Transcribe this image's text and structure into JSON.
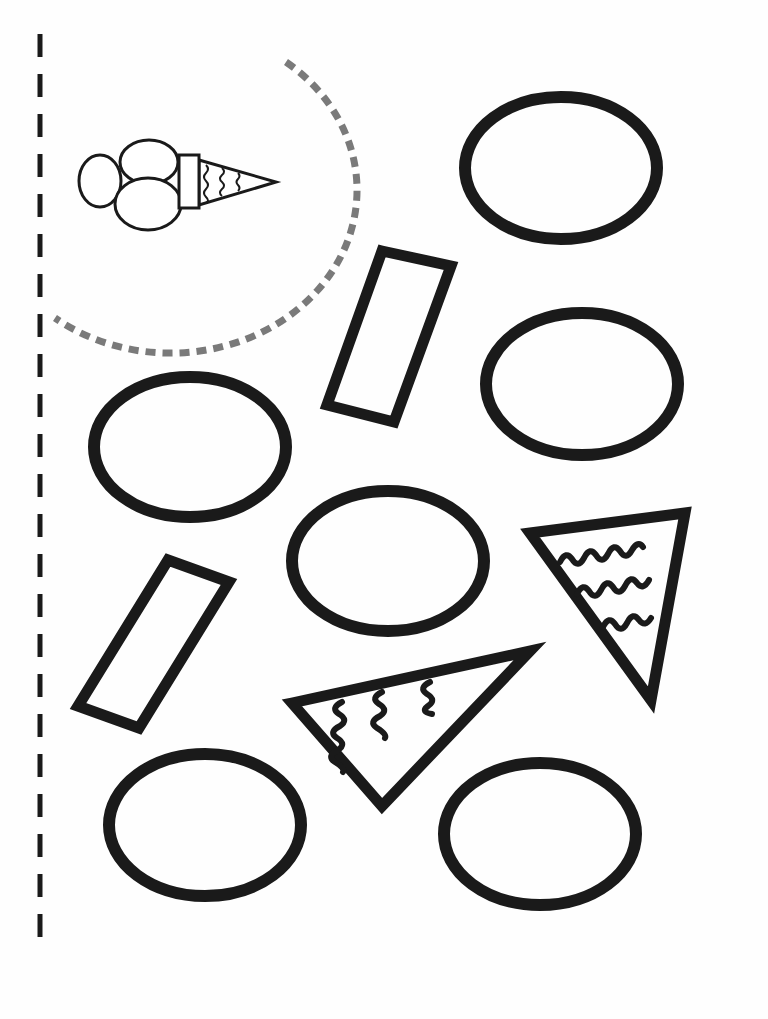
{
  "worksheet": {
    "title": "Ice cream cut-and-paste shapes",
    "stroke_color": "#1a1a1a",
    "guide_color": "#7a7a7a",
    "paper_color": "#fefefe"
  },
  "cut_line": {
    "x": 40,
    "y_start": 34,
    "y_end": 968,
    "dash": 23,
    "gap": 17,
    "width": 5
  },
  "guide_arc": {
    "path": "M 286 62 A 183 160 0 1 1 55 318",
    "dash": "10 7",
    "width": 7
  },
  "sample_icon": {
    "name": "ice-cream-cone",
    "scoops": [
      {
        "cx": 100,
        "cy": 181,
        "rx": 21,
        "ry": 26
      },
      {
        "cx": 149,
        "cy": 162,
        "rx": 29,
        "ry": 22
      },
      {
        "cx": 148,
        "cy": 204,
        "rx": 33,
        "ry": 26
      }
    ],
    "band": {
      "x": 179,
      "y": 155,
      "w": 20,
      "h": 53
    },
    "cone": "199,160 276,182 199,205",
    "waves": [
      "M 206 165 q 4 4 0 8 q -4 4 0 8 q 4 4 0 8 q -4 4 0 8 q 4 4 0 6",
      "M 222 168 q 4 4 0 7 q -4 4 0 7 q 4 4 0 7 q -4 4 0 7",
      "M 238 173 q 3 3 0 6 q -3 3 0 6 q 3 3 0 6"
    ],
    "stroke_width": 3
  },
  "ovals": [
    {
      "id": 1,
      "cx": 561,
      "cy": 168,
      "rx": 102,
      "ry": 77
    },
    {
      "id": 2,
      "cx": 582,
      "cy": 384,
      "rx": 102,
      "ry": 77
    },
    {
      "id": 3,
      "cx": 190,
      "cy": 447,
      "rx": 102,
      "ry": 76
    },
    {
      "id": 4,
      "cx": 388,
      "cy": 561,
      "rx": 102,
      "ry": 76
    },
    {
      "id": 5,
      "cx": 205,
      "cy": 825,
      "rx": 102,
      "ry": 77
    },
    {
      "id": 6,
      "cx": 540,
      "cy": 834,
      "rx": 102,
      "ry": 77
    }
  ],
  "oval_stroke": 12,
  "bands": [
    {
      "id": 1,
      "points": "382,251 451,266 394,422 327,405"
    },
    {
      "id": 2,
      "points": "168,560 229,582 139,728 78,706"
    }
  ],
  "band_stroke": 11,
  "cones": [
    {
      "id": 1,
      "points": "530,533 685,513 651,700",
      "waves": [
        "M 560 562 q 6 -12 12 -3 q 6 10 12 -1 q 6 -12 12 -3 q 6 10 12 -1 q 6 -12 12 -3 q 6 10 12 -1 q 6 -10 11 -3",
        "M 577 594 q 6 -12 12 -3 q 6 10 12 -1 q 6 -12 12 -3 q 6 10 12 -1 q 6 -12 12 -3 q 6 8 12 -3",
        "M 603 627 q 6 -12 12 -3 q 6 10 12 -1 q 6 -12 12 -3 q 6 8 12 -2"
      ]
    },
    {
      "id": 2,
      "points": "292,703 530,651 382,806",
      "waves": [
        "M 342 702 q -12 6 -3 12 q 10 6 1 12 q -12 6 -3 12 q 10 6 1 12 q -12 6 -3 12 q 10 6 8 10",
        "M 382 692 q -12 6 -3 12 q 10 6 1 12 q -12 6 -3 12 q 10 6 8 10",
        "M 430 682 q -12 6 -3 12 q 10 6 1 12 q -8 6 4 8"
      ]
    }
  ],
  "cone_stroke": 11,
  "wave_stroke": 6
}
